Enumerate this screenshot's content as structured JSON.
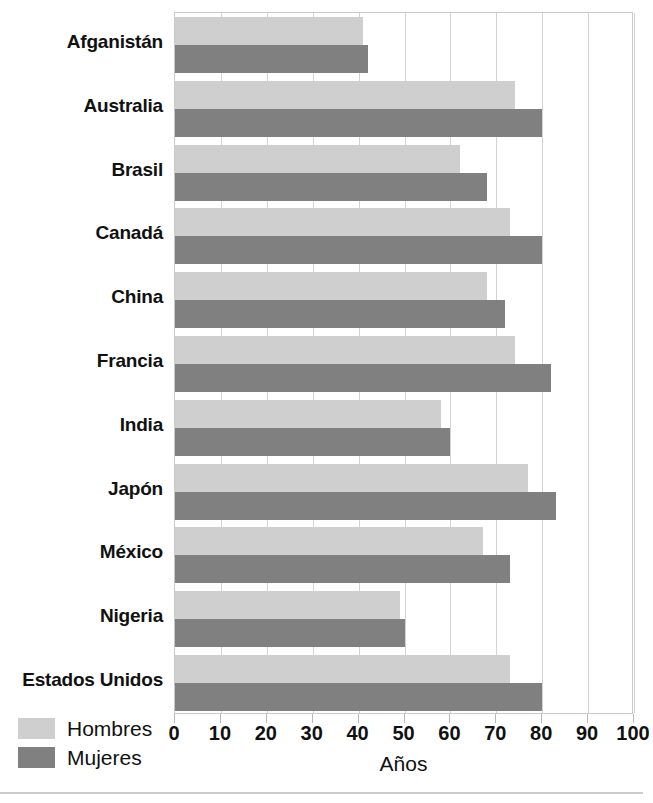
{
  "chart_data": {
    "type": "bar",
    "orientation": "horizontal",
    "title": "",
    "xlabel": "Años",
    "ylabel": "",
    "xlim": [
      0,
      100
    ],
    "xticks": [
      0,
      10,
      20,
      30,
      40,
      50,
      60,
      70,
      80,
      90,
      100
    ],
    "xtick_labels": [
      "0",
      "10",
      "20",
      "30",
      "40",
      "50",
      "60",
      "70",
      "80",
      "90",
      "100"
    ],
    "grid": true,
    "legend_position": "bottom-left",
    "categories": [
      "Afganistán",
      "Australia",
      "Brasil",
      "Canadá",
      "China",
      "Francia",
      "India",
      "Japón",
      "México",
      "Nigeria",
      "Estados Unidos"
    ],
    "series": [
      {
        "name": "Hombres",
        "color": "#cfcfcf",
        "values": [
          41,
          74,
          62,
          73,
          68,
          74,
          58,
          77,
          67,
          49,
          73
        ]
      },
      {
        "name": "Mujeres",
        "color": "#808080",
        "values": [
          42,
          80,
          68,
          80,
          72,
          82,
          60,
          83,
          73,
          50,
          80
        ]
      }
    ]
  },
  "legend": {
    "items": [
      {
        "label": "Hombres",
        "color": "#cfcfcf"
      },
      {
        "label": "Mujeres",
        "color": "#808080"
      }
    ]
  },
  "axis": {
    "x_title": "Años"
  }
}
